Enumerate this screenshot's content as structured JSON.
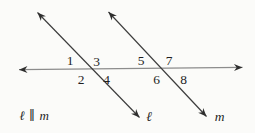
{
  "figure": {
    "angles": [
      "1",
      "2",
      "3",
      "4",
      "5",
      "6",
      "7",
      "8"
    ],
    "line_l_label": "ℓ",
    "line_m_label": "m",
    "given_statement": "ℓ ∥ m"
  },
  "colors": {
    "background": "#fbfbf9",
    "transversal_line": "#3c3c3c",
    "horizontal_line": "#8c8c8c",
    "arrowhead": "#2e2e2e",
    "text": "#1f1f1f"
  }
}
